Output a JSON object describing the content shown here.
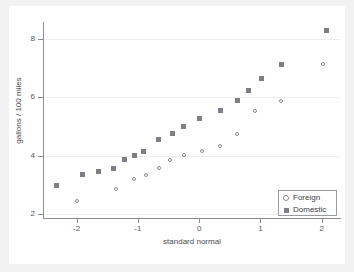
{
  "chart_data": {
    "type": "scatter",
    "title": "",
    "xlabel": "standard normal",
    "ylabel": "gallons / 100 miles",
    "xlim": [
      -2.55,
      2.3
    ],
    "ylim": [
      1.85,
      8.6
    ],
    "xticks": [
      -2,
      -1,
      0,
      1,
      2
    ],
    "xticklabels": [
      "-2",
      "-1",
      "0",
      "1",
      "2"
    ],
    "yticks": [
      2,
      4,
      6,
      8
    ],
    "yticklabels": [
      "2",
      "4",
      "6",
      "8"
    ],
    "grid": "horizontal",
    "legend_position": "bottom-right",
    "series": [
      {
        "name": "Foreign",
        "marker": "open-circle",
        "color": "#8b8b93",
        "points": [
          [
            -2.0,
            2.43
          ],
          [
            -1.35,
            2.84
          ],
          [
            -1.06,
            3.21
          ],
          [
            -0.87,
            3.33
          ],
          [
            -0.65,
            3.57
          ],
          [
            -0.48,
            3.86
          ],
          [
            -0.25,
            4.01
          ],
          [
            0.05,
            4.16
          ],
          [
            0.34,
            4.33
          ],
          [
            0.62,
            4.76
          ],
          [
            0.92,
            5.54
          ],
          [
            1.33,
            5.87
          ],
          [
            2.02,
            7.14
          ]
        ]
      },
      {
        "name": "Domestic",
        "marker": "filled-square",
        "color": "#7e7e87",
        "points": [
          [
            -2.33,
            2.96
          ],
          [
            -1.91,
            3.35
          ],
          [
            -1.64,
            3.44
          ],
          [
            -1.4,
            3.56
          ],
          [
            -1.22,
            3.85
          ],
          [
            -1.05,
            3.99
          ],
          [
            -0.91,
            4.15
          ],
          [
            -0.66,
            4.55
          ],
          [
            -0.44,
            4.76
          ],
          [
            -0.26,
            4.99
          ],
          [
            0.01,
            5.28
          ],
          [
            0.35,
            5.56
          ],
          [
            0.62,
            5.88
          ],
          [
            0.81,
            6.23
          ],
          [
            1.01,
            6.66
          ],
          [
            1.34,
            7.13
          ],
          [
            2.08,
            8.32
          ]
        ]
      }
    ]
  },
  "legend": {
    "entries": [
      {
        "label": "Foreign",
        "key": "open-circle-key"
      },
      {
        "label": "Domestic",
        "key": "filled-square-key"
      }
    ]
  }
}
